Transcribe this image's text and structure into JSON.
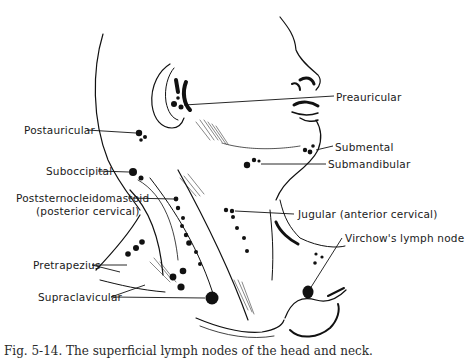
{
  "figure": {
    "type": "anatomical illustration",
    "subject": "superficial lymph nodes of the head and neck",
    "labels": {
      "preauricular": "Preauricular",
      "postauricular": "Postauricular",
      "submental": "Submental",
      "submandibular": "Submandibular",
      "suboccipital": "Suboccipital",
      "poststernocleidomastoid_line1": "Poststernocleidomastoid",
      "poststernocleidomastoid_line2": "(posterior cervical)",
      "jugular": "Jugular (anterior cervical)",
      "virchow": "Virchow's lymph node",
      "pretrapezius": "Pretrapezius",
      "supraclavicular": "Supraclavicular"
    },
    "caption": "Fig. 5-14. The superficial lymph nodes of the head and neck."
  }
}
